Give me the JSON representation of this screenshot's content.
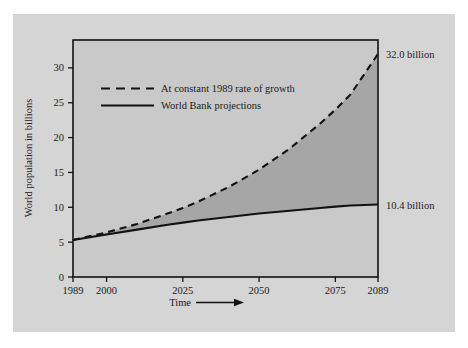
{
  "figure": {
    "background_color": "#ffffff",
    "panel_color": "#d5d5d5",
    "plot_upper_color": "#c9c9c9",
    "plot_band_color": "#a6a6a6",
    "line_color": "#121212",
    "axis_color": "#121212"
  },
  "chart_data": {
    "type": "line",
    "title": "",
    "subtitle": "",
    "xlabel": "Time",
    "ylabel": "World population in billions",
    "xlim": [
      1989,
      2089
    ],
    "ylim": [
      0,
      34
    ],
    "grid": false,
    "legend_position": "upper-left-inside",
    "xticks": [
      1989,
      2000,
      2025,
      2050,
      2075,
      2089
    ],
    "xtick_labels": [
      "1989",
      "2000",
      "2025",
      "2050",
      "2075",
      "2089"
    ],
    "yticks": [
      0,
      5,
      10,
      15,
      20,
      25,
      30
    ],
    "ytick_labels": [
      "0",
      "5",
      "10",
      "15",
      "20",
      "25",
      "30"
    ],
    "x": [
      1989,
      2000,
      2010,
      2020,
      2025,
      2030,
      2040,
      2050,
      2060,
      2070,
      2075,
      2080,
      2089
    ],
    "series": [
      {
        "name": "At constant 1989 rate of growth",
        "style": "dashed",
        "values": [
          5.3,
          6.4,
          7.6,
          9.1,
          9.9,
          10.8,
          12.9,
          15.4,
          18.4,
          22.0,
          24.0,
          26.2,
          32.0
        ],
        "end_label": "32.0 billion",
        "end_value": 32.0
      },
      {
        "name": "World Bank projections",
        "style": "solid",
        "values": [
          5.3,
          6.1,
          6.8,
          7.5,
          7.8,
          8.1,
          8.6,
          9.1,
          9.5,
          9.9,
          10.1,
          10.25,
          10.4
        ],
        "end_label": "10.4 billion",
        "end_value": 10.4
      }
    ],
    "annotations": [
      {
        "text": "32.0 billion",
        "at_x": 2089,
        "at_y": 32.0
      },
      {
        "text": "10.4 billion",
        "at_x": 2089,
        "at_y": 10.4
      }
    ],
    "shaded_region": {
      "between": [
        "At constant 1989 rate of growth",
        "World Bank projections"
      ],
      "color": "#a6a6a6"
    }
  },
  "axis": {
    "x_title": "Time",
    "x_arrow": "arrow-right-icon",
    "y_title": "World population in billions"
  },
  "legend": {
    "items": [
      {
        "label": "At constant 1989 rate of growth",
        "style": "dashed"
      },
      {
        "label": "World Bank projections",
        "style": "solid"
      }
    ]
  }
}
